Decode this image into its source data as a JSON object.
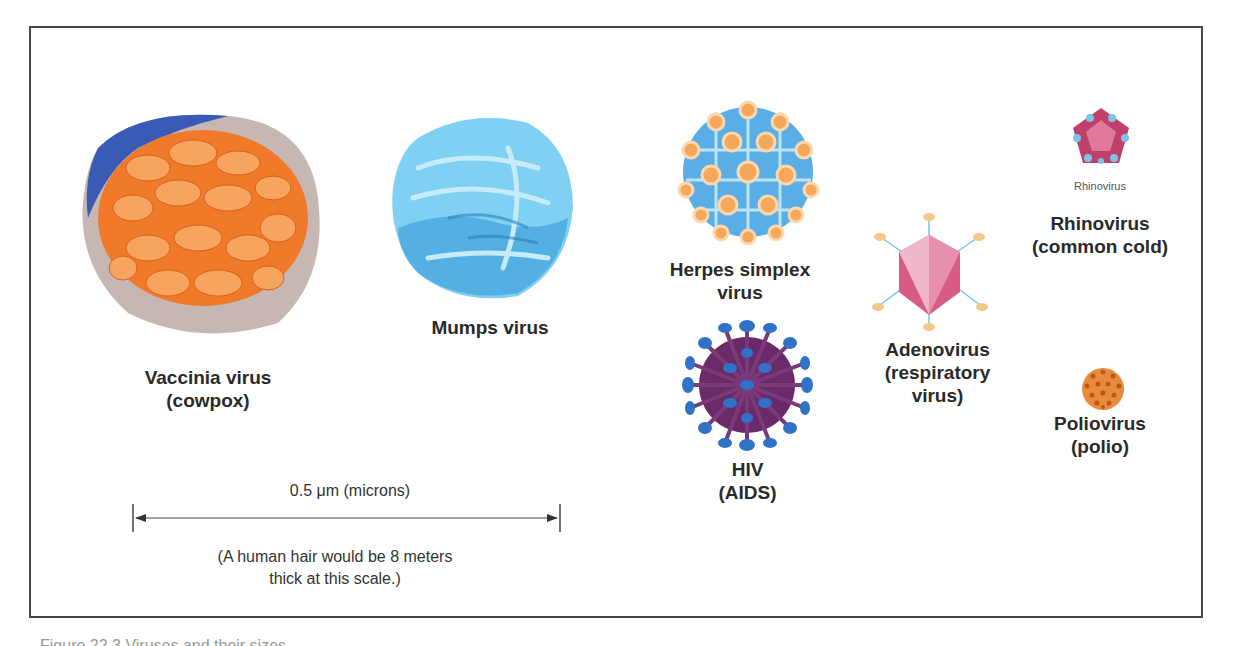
{
  "figure": {
    "viruses": [
      {
        "id": "vaccinia",
        "name_line1": "Vaccinia virus",
        "name_line2": "(cowpox)",
        "icon": "vaccinia-virus-illustration",
        "colors": {
          "body": "#f07a2a",
          "envelope": "#c9b9b4",
          "shadow": "#3a5bb5"
        }
      },
      {
        "id": "mumps",
        "name_line1": "Mumps virus",
        "name_line2": "",
        "icon": "mumps-virus-illustration",
        "colors": {
          "body": "#6cc6ee",
          "dark": "#3a8fd0"
        }
      },
      {
        "id": "herpes",
        "name_line1": "Herpes simplex",
        "name_line2": "virus",
        "icon": "herpes-virus-illustration",
        "colors": {
          "body": "#5aaee6",
          "capsomere": "#f5a85a"
        }
      },
      {
        "id": "hiv",
        "name_line1": "HIV",
        "name_line2": "(AIDS)",
        "icon": "hiv-virus-illustration",
        "colors": {
          "body": "#6a2a6a",
          "spike": "#2f72c8"
        }
      },
      {
        "id": "adeno",
        "name_line1": "Adenovirus",
        "name_line2": "(respiratory",
        "name_line3": "virus)",
        "icon": "adenovirus-illustration",
        "colors": {
          "body": "#d85a86",
          "fiber": "#f3c98a"
        }
      },
      {
        "id": "rhino",
        "name_line1": "Rhinovirus",
        "name_line2": "(common cold)",
        "small_label": "Rhinovirus",
        "icon": "rhinovirus-illustration",
        "colors": {
          "body": "#c0406a",
          "accent": "#7cc3e8"
        }
      },
      {
        "id": "polio",
        "name_line1": "Poliovirus",
        "name_line2": "(polio)",
        "icon": "poliovirus-illustration",
        "colors": {
          "body": "#e88c3c",
          "dot": "#b85a20"
        }
      }
    ],
    "scale_bar": {
      "label": "0.5 μm (microns)",
      "note_line1": "(A human hair would be 8 meters",
      "note_line2": "thick at this scale.)"
    }
  },
  "caption": {
    "text": "Figure 22.3 Viruses and their sizes"
  }
}
